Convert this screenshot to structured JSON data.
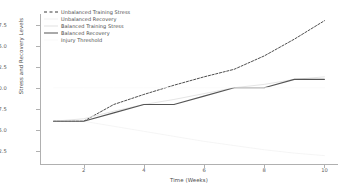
{
  "chart_data": {
    "type": "line",
    "title": "",
    "xlabel": "Time (Weeks)",
    "ylabel": "Stress and Recovery Levels",
    "x": [
      1,
      2,
      3,
      4,
      5,
      6,
      7,
      8,
      9,
      10
    ],
    "xlim": [
      0.55,
      10.45
    ],
    "ylim": [
      0.9,
      18.8
    ],
    "xticks": [
      2,
      4,
      6,
      8,
      10
    ],
    "yticks": [
      2.5,
      5.0,
      7.5,
      10.0,
      12.5,
      15.0,
      17.5
    ],
    "xtick_labels": [
      "2",
      "4",
      "6",
      "8",
      "10"
    ],
    "ytick_labels": [
      "2.5",
      "5.0",
      "7.5",
      "10.0",
      "12.5",
      "15.0",
      "17.5"
    ],
    "grid": false,
    "legend_position": "upper left",
    "series": [
      {
        "name": "Unbalanced Training Stress",
        "values": [
          6.0,
          6.0,
          8.0,
          9.2,
          10.3,
          11.3,
          12.2,
          13.8,
          15.8,
          18.0
        ],
        "style": "dashed",
        "color": "#3a3a3a",
        "width": 0.9
      },
      {
        "name": "Unbalanced Recovery",
        "values": [
          6.0,
          6.0,
          5.4,
          4.8,
          4.2,
          3.6,
          3.1,
          2.6,
          2.2,
          1.9
        ],
        "style": "solid",
        "color": "#f2f2f2",
        "width": 0.8
      },
      {
        "name": "Balanced Training Stress",
        "values": [
          6.0,
          6.3,
          7.2,
          8.0,
          8.6,
          9.3,
          10.0,
          10.4,
          11.0,
          11.3
        ],
        "style": "solid",
        "color": "#e2e2e2",
        "width": 0.9
      },
      {
        "name": "Balanced Recovery",
        "values": [
          6.0,
          6.0,
          7.0,
          8.0,
          8.0,
          9.0,
          10.0,
          10.0,
          11.0,
          11.0
        ],
        "style": "solid",
        "color": "#555555",
        "width": 1.1
      },
      {
        "name": "Injury Threshold",
        "values": [
          10.0,
          10.0,
          10.0,
          10.0,
          10.0,
          10.0,
          10.0,
          10.0,
          10.0,
          10.0
        ],
        "style": "solid",
        "color": "#fafafa",
        "width": 0.8
      }
    ]
  }
}
